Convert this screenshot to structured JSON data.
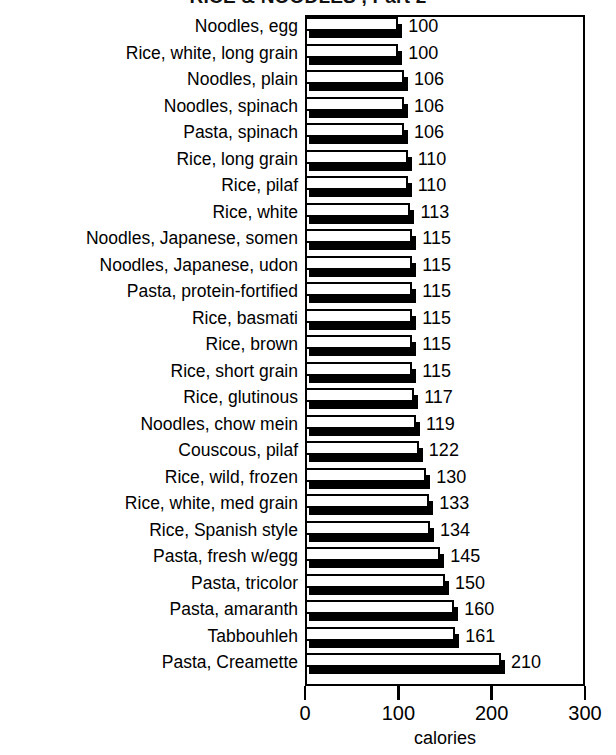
{
  "chart_data": {
    "type": "bar",
    "orientation": "horizontal",
    "title": "RICE & NOODLES , Part 2",
    "xlabel": "calories",
    "ylabel": "",
    "xlim": [
      0,
      300
    ],
    "xticks": [
      0,
      100,
      200,
      300
    ],
    "xtick_labels": [
      "0",
      "100",
      "200",
      "300"
    ],
    "grid": false,
    "legend": null,
    "categories": [
      "Noodles, egg",
      "Rice, white, long grain",
      "Noodles, plain",
      "Noodles, spinach",
      "Pasta, spinach",
      "Rice, long grain",
      "Rice, pilaf",
      "Rice, white",
      "Noodles, Japanese, somen",
      "Noodles, Japanese, udon",
      "Pasta, protein-fortified",
      "Rice, basmati",
      "Rice, brown",
      "Rice, short grain",
      "Rice, glutinous",
      "Noodles, chow mein",
      "Couscous, pilaf",
      "Rice, wild, frozen",
      "Rice, white, med grain",
      "Rice, Spanish style",
      "Pasta, fresh w/egg",
      "Pasta, tricolor",
      "Pasta, amaranth",
      "Tabbouhleh",
      "Pasta, Creamette"
    ],
    "values": [
      100,
      100,
      106,
      106,
      106,
      110,
      110,
      113,
      115,
      115,
      115,
      115,
      115,
      115,
      117,
      119,
      122,
      130,
      133,
      134,
      145,
      150,
      160,
      161,
      210
    ],
    "value_labels": [
      "100",
      "100",
      "106",
      "106",
      "106",
      "110",
      "110",
      "113",
      "115",
      "115",
      "115",
      "115",
      "115",
      "115",
      "117",
      "119",
      "122",
      "130",
      "133",
      "134",
      "145",
      "150",
      "160",
      "161",
      "210"
    ],
    "colors": {
      "bar_face": "#ffffff",
      "bar_edge": "#000000",
      "bar_shadow": "#000000",
      "background": "#ffffff",
      "text": "#000000"
    }
  }
}
